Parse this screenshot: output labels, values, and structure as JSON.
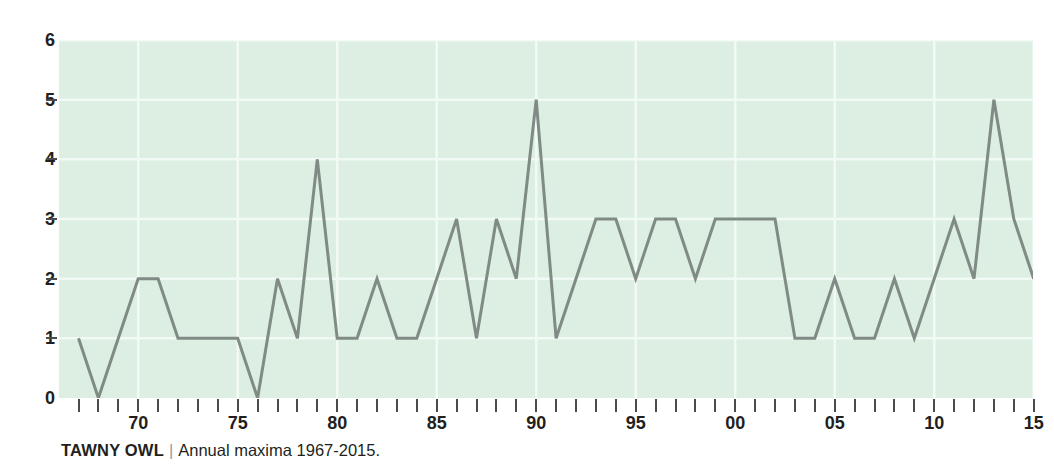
{
  "caption": {
    "species": "TAWNY OWL",
    "separator": "|",
    "description": "Annual maxima 1967-2015."
  },
  "colors": {
    "plot_background": "#dcefe2",
    "line": "#7f8b84",
    "gridline": "#f2faf5",
    "text": "#231f20",
    "tick": "#4b4b4b"
  },
  "axes": {
    "y_ticks": [
      0,
      1,
      2,
      3,
      4,
      5,
      6
    ],
    "y_tick_labels": [
      "0",
      "1",
      "2",
      "3",
      "4",
      "5",
      "6"
    ],
    "x_tick_labels": [
      "70",
      "75",
      "80",
      "85",
      "90",
      "95",
      "00",
      "05",
      "10",
      "15"
    ],
    "x_tick_label_years": [
      1970,
      1975,
      1980,
      1985,
      1990,
      1995,
      2000,
      2005,
      2010,
      2015
    ]
  },
  "chart_data": {
    "type": "line",
    "title": "TAWNY OWL",
    "subtitle": "Annual maxima 1967-2015.",
    "xlabel": "",
    "ylabel": "",
    "xlim": [
      1967,
      2015
    ],
    "ylim": [
      0,
      6
    ],
    "grid": true,
    "legend": "none",
    "x": [
      1967,
      1968,
      1969,
      1970,
      1971,
      1972,
      1973,
      1974,
      1975,
      1976,
      1977,
      1978,
      1979,
      1980,
      1981,
      1982,
      1983,
      1984,
      1985,
      1986,
      1987,
      1988,
      1989,
      1990,
      1991,
      1992,
      1993,
      1994,
      1995,
      1996,
      1997,
      1998,
      1999,
      2000,
      2001,
      2002,
      2003,
      2004,
      2005,
      2006,
      2007,
      2008,
      2009,
      2010,
      2011,
      2012,
      2013,
      2014,
      2015
    ],
    "values": [
      1,
      0,
      1,
      2,
      2,
      1,
      1,
      1,
      1,
      0,
      2,
      1,
      4,
      1,
      1,
      2,
      1,
      1,
      2,
      3,
      1,
      3,
      2,
      5,
      1,
      2,
      3,
      3,
      2,
      3,
      3,
      2,
      3,
      3,
      3,
      3,
      1,
      1,
      2,
      1,
      1,
      2,
      1,
      2,
      3,
      2,
      5,
      3,
      2
    ],
    "series": [
      {
        "name": "Annual maxima",
        "values": [
          1,
          0,
          1,
          2,
          2,
          1,
          1,
          1,
          1,
          0,
          2,
          1,
          4,
          1,
          1,
          2,
          1,
          1,
          2,
          3,
          1,
          3,
          2,
          5,
          1,
          2,
          3,
          3,
          2,
          3,
          3,
          2,
          3,
          3,
          3,
          3,
          1,
          1,
          2,
          1,
          1,
          2,
          1,
          2,
          3,
          2,
          5,
          3,
          2
        ]
      }
    ]
  }
}
